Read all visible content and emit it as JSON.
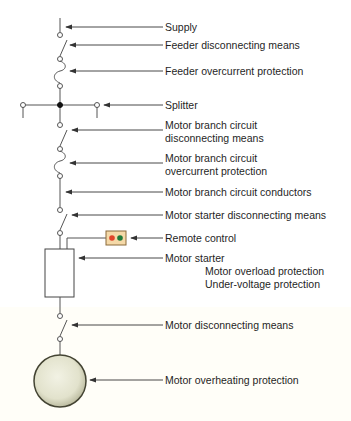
{
  "diagram": {
    "labels": {
      "supply": "Supply",
      "feeder_disconnect": "Feeder disconnecting means",
      "feeder_overcurrent": "Feeder overcurrent protection",
      "splitter": "Splitter",
      "mbc_disconnect_l1": "Motor branch circuit",
      "mbc_disconnect_l2": "disconnecting means",
      "mbc_overcurrent_l1": "Motor branch circuit",
      "mbc_overcurrent_l2": "overcurrent protection",
      "mbc_conductors": "Motor branch circuit conductors",
      "starter_disconnect": "Motor starter disconnecting means",
      "remote_control": "Remote control",
      "motor_starter": "Motor starter",
      "overload": "Motor overload protection",
      "undervoltage": "Under-voltage protection",
      "motor_disconnect": "Motor disconnecting means",
      "overheating": "Motor overheating protection"
    },
    "colors": {
      "line": "#555555",
      "remote_box": "#f5d9a8",
      "remote_red": "#e0442a",
      "remote_green": "#1f7a3a",
      "motor_fill": "#e6e6d2",
      "motor_edge": "#444433"
    }
  }
}
